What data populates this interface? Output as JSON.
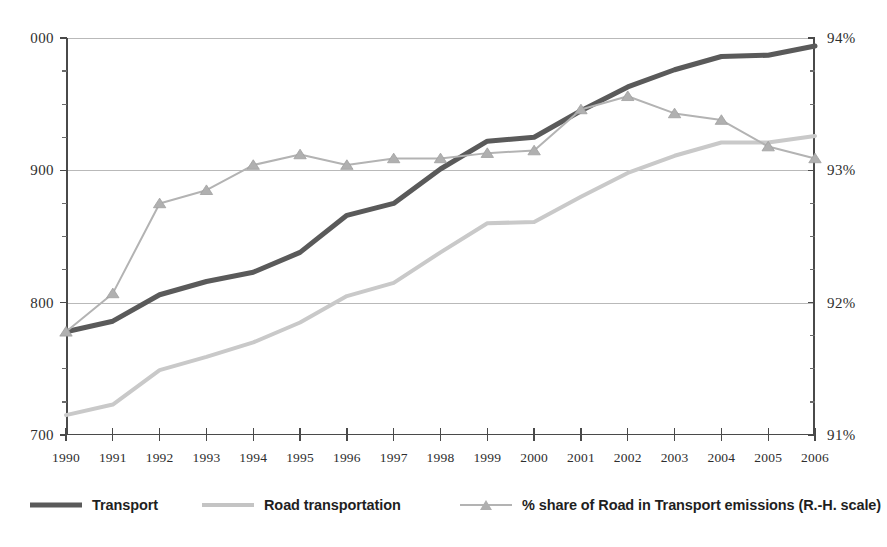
{
  "chart_data": {
    "type": "line",
    "title": "",
    "subtitle": "",
    "xlabel": "",
    "ylabel": "",
    "grid": true,
    "legend_position": "bottom",
    "categories": [
      "1990",
      "1991",
      "1992",
      "1993",
      "1994",
      "1995",
      "1996",
      "1997",
      "1998",
      "1999",
      "2000",
      "2001",
      "2002",
      "2003",
      "2004",
      "2005",
      "2006"
    ],
    "x": [
      1990,
      1991,
      1992,
      1993,
      1994,
      1995,
      1996,
      1997,
      1998,
      1999,
      2000,
      2001,
      2002,
      2003,
      2004,
      2005,
      2006
    ],
    "axes": {
      "left": {
        "label": "",
        "ylim": [
          700,
          1000
        ],
        "ticks": [
          700,
          800,
          900,
          1000
        ],
        "ticklabels": [
          "700",
          "800",
          "900",
          "000"
        ],
        "minor_ticks": [
          725,
          750,
          775,
          825,
          850,
          875,
          925,
          950,
          975
        ]
      },
      "right": {
        "label": "",
        "ylim": [
          91,
          94
        ],
        "ticks": [
          91,
          92,
          93,
          94
        ],
        "ticklabels": [
          "91%",
          "92%",
          "93%",
          "94%"
        ],
        "minor_ticks": [
          91.25,
          91.5,
          91.75,
          92.25,
          92.5,
          92.75,
          93.25,
          93.5,
          93.75
        ]
      }
    },
    "series": [
      {
        "name": "Transport",
        "axis": "left",
        "color": "#5a5a5a",
        "width": 5,
        "marker": "none",
        "values": [
          778,
          786,
          806,
          816,
          823,
          838,
          866,
          875,
          901,
          922,
          925,
          945,
          963,
          976,
          986,
          987,
          994
        ]
      },
      {
        "name": "Road transportation",
        "axis": "left",
        "color": "#c9c9c9",
        "width": 4,
        "marker": "none",
        "values": [
          715,
          723,
          749,
          759,
          770,
          785,
          805,
          815,
          838,
          860,
          861,
          880,
          898,
          911,
          921,
          921,
          926
        ]
      },
      {
        "name": "% share of Road in Transport emissions (R.-H. scale)",
        "axis": "right",
        "color": "#b3b3b3",
        "width": 2,
        "marker": "triangle",
        "values": [
          91.78,
          92.07,
          92.75,
          92.85,
          93.04,
          93.12,
          93.04,
          93.09,
          93.09,
          93.13,
          93.15,
          93.46,
          93.56,
          93.43,
          93.38,
          93.18,
          93.09
        ]
      }
    ]
  },
  "legend": {
    "items": [
      {
        "label": "Transport",
        "swatch": "thick-line",
        "color": "#5a5a5a"
      },
      {
        "label": "Road transportation",
        "swatch": "medium-line",
        "color": "#c4c4c4"
      },
      {
        "label": "% share of Road in Transport emissions (R.-H. scale)",
        "swatch": "line-with-triangle-marker",
        "color": "#b3b3b3"
      }
    ]
  }
}
